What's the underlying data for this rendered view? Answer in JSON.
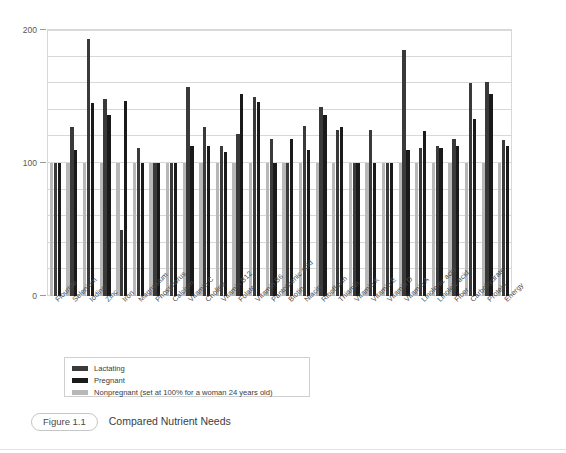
{
  "caption": {
    "figure_number": "Figure 1.1",
    "title": "Compared Nutrient Needs"
  },
  "legend": {
    "items": [
      {
        "label": "Lactating",
        "color": "#3a3a3a",
        "key": "lactating"
      },
      {
        "label": "Pregnant",
        "color": "#1a1a1a",
        "key": "pregnant"
      },
      {
        "label": "Nonpregnant (set at 100% for a woman 24 years old)",
        "color": "#b8b8b8",
        "key": "nonpregnant"
      }
    ]
  },
  "chart_data": {
    "type": "bar",
    "title": "Compared Nutrient Needs",
    "xlabel": "",
    "ylabel": "",
    "ylim": [
      0,
      200
    ],
    "yticks": [
      0,
      100,
      200
    ],
    "ytick_labels": [
      "0",
      "100",
      "200"
    ],
    "gridline_interval": 20,
    "grid": true,
    "legend_position": "below-plot-left",
    "categories": [
      "Flouride",
      "Selenium",
      "Iodine",
      "Zinc",
      "Iron",
      "Magnesium",
      "Phosphorus",
      "Calcium",
      "Vitamin C",
      "Choline",
      "Vitamin B12",
      "Folate",
      "Vitamin B6",
      "Pantothenic acid",
      "Biotin",
      "Niacin",
      "Riboflavin",
      "Thiamin",
      "Vitamin K",
      "Vitamin E",
      "Vitamin D",
      "Vitamin A",
      "Linolenic acid",
      "Linoleic acid",
      "Fiber",
      "Carbohydrate",
      "Protein",
      "Energy"
    ],
    "series": [
      {
        "name": "Lactating",
        "color": "#3a3a3a",
        "values": [
          100,
          127,
          193,
          148,
          50,
          111,
          100,
          100,
          157,
          127,
          113,
          122,
          150,
          118,
          100,
          128,
          142,
          125,
          100,
          125,
          100,
          185,
          111,
          113,
          118,
          160,
          161,
          117
        ]
      },
      {
        "name": "Pregnant",
        "color": "#1a1a1a",
        "values": [
          100,
          110,
          145,
          136,
          147,
          100,
          100,
          100,
          113,
          113,
          108,
          152,
          146,
          100,
          118,
          110,
          136,
          127,
          100,
          100,
          100,
          110,
          124,
          111,
          113,
          133,
          152,
          113
        ]
      },
      {
        "name": "Nonpregnant (set at 100% for a woman 24 years old)",
        "color": "#b8b8b8",
        "values": [
          100,
          100,
          100,
          100,
          100,
          100,
          100,
          100,
          100,
          100,
          100,
          100,
          100,
          100,
          100,
          100,
          100,
          100,
          100,
          100,
          100,
          100,
          100,
          100,
          100,
          100,
          100,
          100
        ]
      }
    ]
  }
}
